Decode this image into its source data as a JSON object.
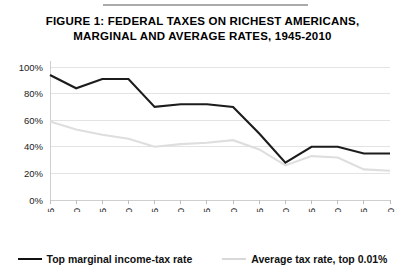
{
  "figure": {
    "title_line1": "FIGURE 1: FEDERAL TAXES ON RICHEST AMERICANS,",
    "title_line2": "MARGINAL AND AVERAGE RATES, 1945-2010"
  },
  "legend": {
    "position": "bottom",
    "entries": [
      {
        "label": "Top marginal income-tax rate",
        "color": "#1c1c1c"
      },
      {
        "label": "Average tax rate, top 0.01%",
        "color": "#dedede"
      }
    ]
  },
  "chart_data": {
    "type": "line",
    "title": "FIGURE 1: FEDERAL TAXES ON RICHEST AMERICANS, MARGINAL AND AVERAGE RATES, 1945-2010",
    "xlabel": "",
    "ylabel": "",
    "grid": true,
    "x": [
      1945,
      1950,
      1955,
      1960,
      1965,
      1970,
      1975,
      1980,
      1985,
      1990,
      1995,
      2000,
      2005,
      2010
    ],
    "categories": [
      "1945",
      "1950",
      "1955",
      "1960",
      "1965",
      "1970",
      "1975",
      "1980",
      "1985",
      "1990",
      "1995",
      "2000",
      "2005",
      "2010"
    ],
    "xlim": [
      1945,
      2010
    ],
    "ylim": [
      0,
      100
    ],
    "yticks": [
      0,
      20,
      40,
      60,
      80,
      100
    ],
    "yticklabels": [
      "0%",
      "20%",
      "40%",
      "60%",
      "80%",
      "100%"
    ],
    "series": [
      {
        "name": "Top marginal income-tax rate",
        "color": "#1c1c1c",
        "values": [
          94,
          84,
          91,
          91,
          70,
          72,
          72,
          70,
          50,
          28,
          40,
          40,
          35,
          35
        ]
      },
      {
        "name": "Average tax rate, top 0.01%",
        "color": "#dedede",
        "values": [
          59,
          53,
          49,
          46,
          40,
          42,
          43,
          45,
          38,
          26,
          33,
          32,
          23,
          22
        ]
      }
    ]
  }
}
